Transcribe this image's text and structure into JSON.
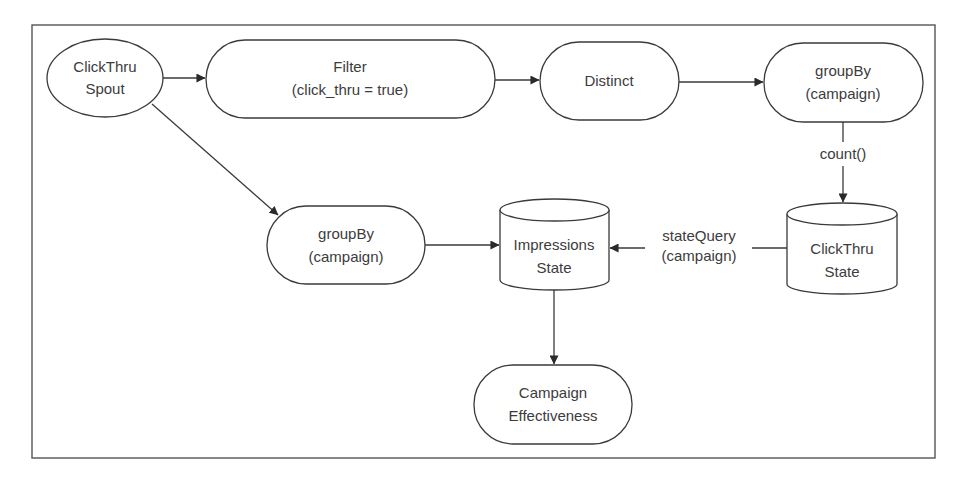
{
  "diagram": {
    "title": "",
    "colors": {
      "stroke": "#3a3a3a",
      "text": "#3c3c3c",
      "background": "#ffffff",
      "frame": "#555555"
    },
    "nodes": {
      "clickthru_spout": {
        "shape": "ellipse",
        "line1": "ClickThru",
        "line2": "Spout"
      },
      "filter": {
        "shape": "rounded-rect",
        "line1": "Filter",
        "line2": "(click_thru = true)"
      },
      "distinct": {
        "shape": "rounded-rect",
        "line1": "Distinct"
      },
      "groupby_top": {
        "shape": "rounded-rect",
        "line1": "groupBy",
        "line2": "(campaign)"
      },
      "clickthru_state": {
        "shape": "cylinder",
        "line1": "ClickThru",
        "line2": "State"
      },
      "impressions_state": {
        "shape": "cylinder",
        "line1": "Impressions",
        "line2": "State"
      },
      "groupby_mid": {
        "shape": "rounded-rect",
        "line1": "groupBy",
        "line2": "(campaign)"
      },
      "campaign_effectiveness": {
        "shape": "rounded-rect",
        "line1": "Campaign",
        "line2": "Effectiveness"
      }
    },
    "edges": [
      {
        "from": "clickthru_spout",
        "to": "filter",
        "label": ""
      },
      {
        "from": "filter",
        "to": "distinct",
        "label": ""
      },
      {
        "from": "distinct",
        "to": "groupby_top",
        "label": ""
      },
      {
        "from": "groupby_top",
        "to": "clickthru_state",
        "label": "count()"
      },
      {
        "from": "clickthru_spout",
        "to": "groupby_mid",
        "label": ""
      },
      {
        "from": "groupby_mid",
        "to": "impressions_state",
        "label": ""
      },
      {
        "from": "clickthru_state",
        "to": "impressions_state",
        "label_line1": "stateQuery",
        "label_line2": "(campaign)"
      },
      {
        "from": "impressions_state",
        "to": "campaign_effectiveness",
        "label": ""
      }
    ],
    "edge_labels": {
      "count": "count()",
      "state_query_line1": "stateQuery",
      "state_query_line2": "(campaign)"
    }
  }
}
